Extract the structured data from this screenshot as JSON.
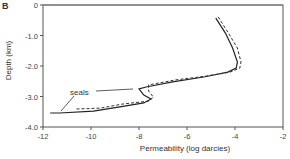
{
  "panel_label": "B",
  "chart_data": {
    "type": "line",
    "title": "",
    "xlabel": "Permeability (log darcies)",
    "ylabel": "Depth (km)",
    "xlim": [
      -12,
      -2
    ],
    "ylim": [
      -4.0,
      0
    ],
    "x_ticks": [
      "-12",
      "-10",
      "-8",
      "-6",
      "-4",
      "-2"
    ],
    "y_ticks": [
      "0",
      "-1.0",
      "-2.0",
      "-3.0",
      "-4.0"
    ],
    "grid": false,
    "legend": null,
    "annotations": [
      {
        "text": "seals",
        "points_to": [
          [
            -8.2,
            -2.75
          ],
          [
            -11.2,
            -3.45
          ]
        ]
      }
    ],
    "series": [
      {
        "name": "solid",
        "style": "solid",
        "x": [
          -4.8,
          -4.4,
          -4.1,
          -3.9,
          -3.95,
          -4.3,
          -5.3,
          -6.6,
          -7.7,
          -8.0,
          -7.8,
          -7.5,
          -7.8,
          -8.8,
          -9.9,
          -11.3,
          -11.7
        ],
        "y": [
          -0.43,
          -0.92,
          -1.41,
          -1.87,
          -2.07,
          -2.2,
          -2.36,
          -2.52,
          -2.69,
          -2.75,
          -2.95,
          -3.08,
          -3.21,
          -3.34,
          -3.48,
          -3.54,
          -3.54
        ]
      },
      {
        "name": "dashed",
        "style": "dashed",
        "x": [
          -4.7,
          -4.3,
          -3.9,
          -3.75,
          -3.8,
          -4.2,
          -5.2,
          -6.5,
          -7.6,
          -7.6,
          -7.4,
          -7.6,
          -8.7,
          -9.6,
          -10.6
        ],
        "y": [
          -0.39,
          -0.89,
          -1.41,
          -1.87,
          -2.07,
          -2.2,
          -2.33,
          -2.46,
          -2.62,
          -2.82,
          -3.02,
          -3.15,
          -3.25,
          -3.38,
          -3.41
        ]
      }
    ]
  },
  "labels": {
    "panel": "B",
    "xlabel": "Permeability (log darcies)",
    "ylabel": "Depth (km)",
    "annotation": "seals",
    "x_ticks": [
      "-12",
      "-10",
      "-8",
      "-6",
      "-4",
      "-2"
    ],
    "y_ticks": [
      "0",
      "-1.0",
      "-2.0",
      "-3.0",
      "-4.0"
    ]
  }
}
